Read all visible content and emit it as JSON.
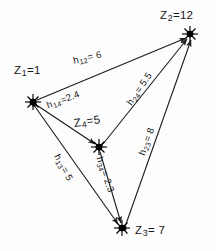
{
  "diagram": {
    "background_color": "#fdfdfd",
    "stroke_color": "#1b1b1b",
    "node_marker": "starburst-dot",
    "edge_style": "double-headed-arrow"
  },
  "nodes": [
    {
      "id": "z1",
      "name": "node-z1",
      "label": "Z",
      "subscript": "1",
      "equals_value": "=1",
      "full_label": "Z1 =1",
      "x": 33,
      "y": 102,
      "label_x": 14,
      "label_y": 64
    },
    {
      "id": "z2",
      "name": "node-z2",
      "label": "Z",
      "subscript": "2",
      "equals_value": "=12",
      "full_label": "Z2 =12",
      "x": 190,
      "y": 34,
      "label_x": 160,
      "label_y": 9
    },
    {
      "id": "z3",
      "name": "node-z3",
      "label": "Z",
      "subscript": "3",
      "equals_value": "= 7",
      "full_label": "Z3 = 7",
      "x": 122,
      "y": 228,
      "label_x": 135,
      "label_y": 224
    },
    {
      "id": "z4",
      "name": "node-z4",
      "label": "Z",
      "subscript": "4",
      "equals_value": "=5",
      "full_label": "Z4 =5",
      "x": 99,
      "y": 147,
      "label_x": 73,
      "label_y": 117
    }
  ],
  "edges": [
    {
      "id": "h12",
      "name": "edge-z1-z2",
      "from": "z1",
      "to": "z2",
      "label": "h",
      "subscript": "12",
      "equals_value": "= 6",
      "weight": 6,
      "full_label": "h12 = 6",
      "label_x": 72,
      "label_y": 55,
      "rotation": -13
    },
    {
      "id": "h14",
      "name": "edge-z1-z4",
      "from": "z1",
      "to": "z4",
      "label": "h",
      "subscript": "14",
      "equals_value": "=2.4",
      "weight": 2.4,
      "full_label": "h14 =2.4",
      "label_x": 45,
      "label_y": 100,
      "rotation": -20
    },
    {
      "id": "h24",
      "name": "edge-z2-z4",
      "from": "z2",
      "to": "z4",
      "label": "h",
      "subscript": "24",
      "equals_value": "= 5.5",
      "weight": 5.5,
      "full_label": "h24 = 5.5",
      "label_x": 124,
      "label_y": 100,
      "rotation": -56
    },
    {
      "id": "h23",
      "name": "edge-z2-z3",
      "from": "z2",
      "to": "z3",
      "label": "h",
      "subscript": "23",
      "equals_value": "= 8",
      "weight": 8,
      "full_label": "h23 = 8",
      "label_x": 136,
      "label_y": 150,
      "rotation": -70
    },
    {
      "id": "h13",
      "name": "edge-z1-z3",
      "from": "z1",
      "to": "z3",
      "label": "h",
      "subscript": "13",
      "equals_value": "= 5",
      "weight": 5,
      "full_label": "h13 = 5",
      "label_x": 63,
      "label_y": 155,
      "rotation": 62
    },
    {
      "id": "h34",
      "name": "edge-z3-z4",
      "from": "z3",
      "to": "z4",
      "label": "h",
      "subscript": "34",
      "equals_value": "= 2.3",
      "weight": 2.3,
      "full_label": "h34 = 2.3",
      "label_x": 104,
      "label_y": 155,
      "rotation": 71
    }
  ]
}
